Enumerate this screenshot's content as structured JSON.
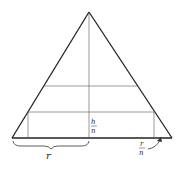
{
  "diagram": {
    "colors": {
      "stroke": "#222222",
      "thin_stroke": "#555555",
      "background": "#ffffff"
    },
    "labels": {
      "radius": "r",
      "slice_height_num": "h",
      "slice_height_den": "n",
      "radius_step_num": "r",
      "radius_step_den": "n"
    },
    "geometry": {
      "apex": [
        89,
        12
      ],
      "base_left": [
        12,
        138
      ],
      "base_right": [
        172,
        138
      ],
      "slice_lines_y": [
        86,
        112
      ]
    }
  }
}
